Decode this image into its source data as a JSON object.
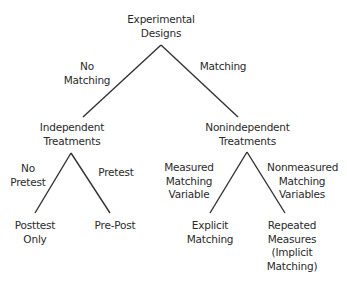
{
  "diagram": {
    "nodes": {
      "root": "Experimental\nDesigns",
      "independent": "Independent\nTreatments",
      "nonindependent": "Nonindependent\nTreatments",
      "posttest_only": "Posttest\nOnly",
      "pre_post": "Pre-Post",
      "explicit_matching": "Explicit\nMatching",
      "repeated_measures": "Repeated\nMeasures\n(Implicit\nMatching)"
    },
    "edges": {
      "no_matching": "No\nMatching",
      "matching": "Matching",
      "no_pretest": "No\nPretest",
      "pretest": "Pretest",
      "measured": "Measured\nMatching\nVariable",
      "nonmeasured": "Nonmeasured\nMatching\nVariables"
    },
    "line_color": "#333333"
  }
}
